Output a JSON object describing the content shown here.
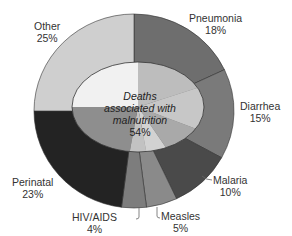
{
  "chart_data": {
    "type": "pie",
    "title": "",
    "subtitle": "",
    "variant": "nested-donut",
    "start_angle_deg": 0,
    "direction": "clockwise",
    "outer_ring": {
      "categories": [
        "Pneumonia",
        "Diarrhea",
        "Malaria",
        "Measles",
        "HIV/AIDS",
        "Perinatal",
        "Other"
      ],
      "values": [
        18,
        15,
        10,
        5,
        4,
        23,
        25
      ],
      "labels": [
        "18%",
        "15%",
        "10%",
        "5%",
        "4%",
        "23%",
        "25%"
      ],
      "colors": [
        "#6e6e6e",
        "#7a7a7a",
        "#4a4a4a",
        "#8a8a8a",
        "#7d7d7d",
        "#232323",
        "#cfcfcf"
      ]
    },
    "inner_ellipse": {
      "label": "Deaths associated with malnutrition",
      "value": 54,
      "value_label": "54%",
      "segment_colors": [
        "#bdbdbd",
        "#c7c7c7",
        "#a9a9a9",
        "#d2d2d2",
        "#c2c2c2",
        "#8e8e8e",
        "#f1f1f1"
      ]
    },
    "legend": "none (direct labels)"
  },
  "labels": {
    "pneumonia": {
      "name": "Pneumonia",
      "pct": "18%"
    },
    "diarrhea": {
      "name": "Diarrhea",
      "pct": "15%"
    },
    "malaria": {
      "name": "Malaria",
      "pct": "10%"
    },
    "measles": {
      "name": "Measles",
      "pct": "5%"
    },
    "hiv": {
      "name": "HIV/AIDS",
      "pct": "4%"
    },
    "perinatal": {
      "name": "Perinatal",
      "pct": "23%"
    },
    "other": {
      "name": "Other",
      "pct": "25%"
    },
    "center": {
      "line1": "Deaths",
      "line2": "associated with",
      "line3": "malnutrition",
      "pct": "54%"
    }
  },
  "colors": {
    "background": "#ffffff",
    "outline": "#333333",
    "text": "#333333",
    "leader_line": "#666666"
  }
}
